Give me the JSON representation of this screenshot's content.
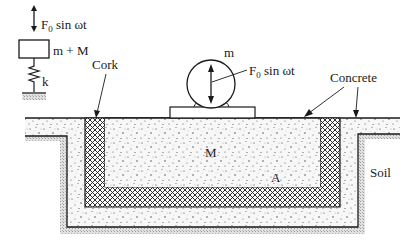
{
  "diagram": {
    "model": {
      "force_label": "F",
      "force_subscript": "0",
      "force_suffix": " sin ωt",
      "mass_label": "m + M",
      "spring_label": "k"
    },
    "machine": {
      "mass_label": "m",
      "force_label": "F",
      "force_subscript": "0",
      "force_suffix": " sin ωt"
    },
    "labels": {
      "cork": "Cork",
      "concrete": "Concrete",
      "block_mass": "M",
      "area": "A",
      "soil": "Soil"
    },
    "colors": {
      "line": "#1a1a1a",
      "concrete_fill": "#f4f4f4",
      "soil_fill": "#d6d6d6",
      "cork_fill": "#ffffff"
    }
  }
}
